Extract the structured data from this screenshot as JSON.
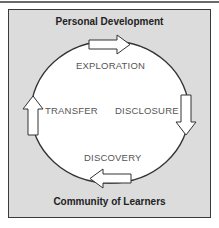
{
  "diagram": {
    "top_label": "Personal Development",
    "bottom_label": "Community of Learners",
    "stages": [
      {
        "name": "EXPLORATION",
        "position": "top"
      },
      {
        "name": "DISCLOSURE",
        "position": "right"
      },
      {
        "name": "DISCOVERY",
        "position": "bottom"
      },
      {
        "name": "TRANSFER",
        "position": "left"
      }
    ],
    "arrows": [
      {
        "direction": "right",
        "position": "top"
      },
      {
        "direction": "down",
        "position": "right"
      },
      {
        "direction": "left",
        "position": "bottom"
      },
      {
        "direction": "up",
        "position": "left"
      }
    ],
    "colors": {
      "frame_fill": "#dcdcdc",
      "frame_border": "#3a3a3a",
      "circle_fill": "#ffffff",
      "circle_stroke": "#333333",
      "stage_text": "#555555",
      "title_text": "#222222"
    }
  }
}
